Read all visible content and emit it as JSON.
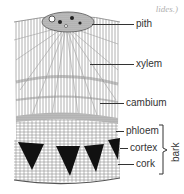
{
  "caption_fragment": "lides.)",
  "diagram": {
    "labels": [
      {
        "id": "pith",
        "text": "pith",
        "y": 24
      },
      {
        "id": "xylem",
        "text": "xylem",
        "y": 64
      },
      {
        "id": "cambium",
        "text": "cambium",
        "y": 103
      },
      {
        "id": "phloem",
        "text": "phloem",
        "y": 131
      },
      {
        "id": "cortex",
        "text": "cortex",
        "y": 148
      },
      {
        "id": "cork",
        "text": "cork",
        "y": 164
      }
    ],
    "group_label": "bark",
    "group_members": [
      "phloem",
      "cortex",
      "cork"
    ]
  },
  "colors": {
    "ink": "#333333",
    "tissue_light": "#bdbdbd",
    "tissue_dark": "#111111",
    "caption": "#b0b0b0"
  }
}
